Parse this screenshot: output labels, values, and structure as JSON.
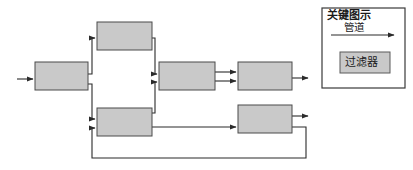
{
  "diagram": {
    "type": "pipe-and-filter-architecture",
    "background_color": "#ffffff",
    "filter_fill_color": "#c9c9c9",
    "filter_stroke_color": "#4a4a4a",
    "pipe_color": "#2b2b2b",
    "filters": [
      {
        "id": "filter-input",
        "label": "",
        "x": 35,
        "y": 62,
        "width": 53,
        "height": 28
      },
      {
        "id": "filter-top",
        "label": "",
        "x": 97,
        "y": 22,
        "width": 55,
        "height": 28
      },
      {
        "id": "filter-bottom-left",
        "label": "",
        "x": 97,
        "y": 108,
        "width": 55,
        "height": 28
      },
      {
        "id": "filter-middle",
        "label": "",
        "x": 159,
        "y": 62,
        "width": 56,
        "height": 28
      },
      {
        "id": "filter-right",
        "label": "",
        "x": 238,
        "y": 62,
        "width": 54,
        "height": 28
      },
      {
        "id": "filter-bottom-right",
        "label": "",
        "x": 238,
        "y": 105,
        "width": 54,
        "height": 28
      }
    ],
    "pipes": [
      {
        "id": "pipe-external-in",
        "from": "external",
        "to": "filter-input"
      },
      {
        "id": "pipe-input-to-top",
        "from": "filter-input",
        "to": "filter-top"
      },
      {
        "id": "pipe-input-to-bottom-left",
        "from": "filter-input",
        "to": "filter-bottom-left"
      },
      {
        "id": "pipe-top-to-middle",
        "from": "filter-top",
        "to": "filter-middle"
      },
      {
        "id": "pipe-bottom-left-to-middle",
        "from": "filter-bottom-left",
        "to": "filter-middle"
      },
      {
        "id": "pipe-middle-to-right-upper",
        "from": "filter-middle",
        "to": "filter-right"
      },
      {
        "id": "pipe-middle-to-right-lower",
        "from": "filter-middle",
        "to": "filter-right"
      },
      {
        "id": "pipe-right-out",
        "from": "filter-right",
        "to": "external"
      },
      {
        "id": "pipe-bottom-left-to-bottom-right",
        "from": "filter-bottom-left",
        "to": "filter-bottom-right"
      },
      {
        "id": "pipe-bottom-right-out",
        "from": "filter-bottom-right",
        "to": "external"
      },
      {
        "id": "pipe-feedback-loop",
        "from": "filter-bottom-right",
        "to": "filter-bottom-left"
      }
    ]
  },
  "legend": {
    "title": "关键图示",
    "pipe_label": "管道",
    "filter_label": "过滤器",
    "box": {
      "x": 322,
      "y": 8,
      "width": 83,
      "height": 80
    },
    "sample_filter": {
      "x": 340,
      "y": 52,
      "width": 50,
      "height": 21
    }
  }
}
